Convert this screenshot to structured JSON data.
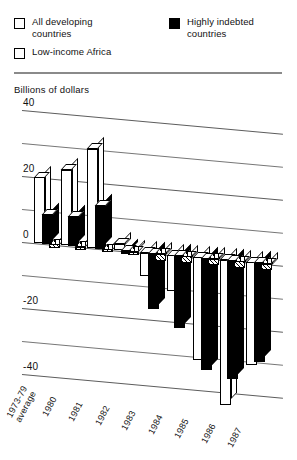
{
  "legend": {
    "items": [
      {
        "key": "all_developing",
        "label": "All developing\ncountries",
        "style": "open"
      },
      {
        "key": "highly_indebted",
        "label": "Highly indebted\ncountries",
        "style": "filled"
      },
      {
        "key": "low_income_africa",
        "label": "Low-income Africa",
        "style": "open"
      }
    ]
  },
  "axis": {
    "title": "Billions of dollars",
    "ticks": [
      "40",
      "20",
      "0",
      "-20",
      "-40"
    ]
  },
  "chart_data": {
    "type": "bar",
    "title": "",
    "subtitle": "",
    "xlabel": "",
    "ylabel": "Billions of dollars",
    "ylim": [
      -50,
      40
    ],
    "yticks": [
      40,
      20,
      0,
      -20,
      -40
    ],
    "grid": true,
    "legend_position": "top",
    "orientation": "vertical-3d-grouped",
    "categories": [
      "1973-79\naverage",
      "1980",
      "1981",
      "1982",
      "1983",
      "1984",
      "1985",
      "1986",
      "1987"
    ],
    "series": [
      {
        "name": "All developing countries",
        "fill": "white",
        "values": [
          20,
          23,
          30,
          2,
          -7,
          -11,
          -31,
          -44,
          -31
        ]
      },
      {
        "name": "Highly indebted countries",
        "fill": "black",
        "values": [
          9,
          9,
          13,
          -1,
          -17,
          -22,
          -34,
          -36,
          -30
        ]
      },
      {
        "name": "Low-income Africa",
        "fill": "hatched",
        "values": [
          -1,
          -1,
          -1,
          -1,
          -2,
          -2,
          -2,
          -2,
          -2
        ]
      }
    ]
  },
  "colors": {
    "all_developing": "#ffffff",
    "highly_indebted": "#000000",
    "low_income_africa": "#ffffff",
    "axis": "#5d5d5d",
    "rule": "#8a8a8a",
    "text": "#111111"
  }
}
